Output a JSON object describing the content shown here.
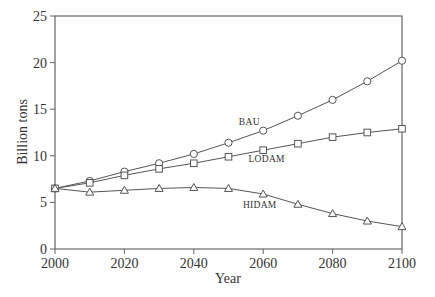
{
  "chart_data": {
    "type": "line",
    "title": "",
    "xlabel": "Year",
    "ylabel": "Billion tons",
    "xlim": [
      2000,
      2100
    ],
    "ylim": [
      0,
      25
    ],
    "x_ticks": [
      2000,
      2020,
      2040,
      2060,
      2080,
      2100
    ],
    "y_ticks": [
      0,
      5,
      10,
      15,
      20,
      25
    ],
    "grid": false,
    "legend": "inline labels",
    "x": [
      2000,
      2010,
      2020,
      2030,
      2040,
      2050,
      2060,
      2070,
      2080,
      2090,
      2100
    ],
    "series": [
      {
        "name": "BAU",
        "marker": "circle",
        "values": [
          6.5,
          7.3,
          8.3,
          9.2,
          10.2,
          11.4,
          12.7,
          14.3,
          16.0,
          18.0,
          20.2
        ],
        "label_pos": {
          "x": 2056,
          "y": 13.3
        }
      },
      {
        "name": "LODAM",
        "marker": "square",
        "values": [
          6.5,
          7.1,
          7.9,
          8.6,
          9.2,
          9.9,
          10.6,
          11.3,
          12.0,
          12.5,
          12.9
        ],
        "label_pos": {
          "x": 2061,
          "y": 9.3
        }
      },
      {
        "name": "HIDAM",
        "marker": "triangle",
        "values": [
          6.5,
          6.1,
          6.3,
          6.5,
          6.6,
          6.5,
          5.9,
          4.8,
          3.8,
          3.0,
          2.4
        ],
        "label_pos": {
          "x": 2059,
          "y": 4.4
        }
      }
    ]
  },
  "colors": {
    "line": "#555555",
    "axis": "#666666",
    "text": "#333333"
  }
}
